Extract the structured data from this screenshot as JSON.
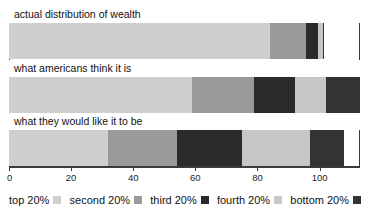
{
  "chart_data": {
    "type": "bar",
    "orientation": "horizontal",
    "stacked": true,
    "title": "",
    "subtitle": "",
    "xlabel": "",
    "ylabel": "",
    "grid": false,
    "legend_position": "bottom",
    "xlim": [
      0,
      113
    ],
    "xticks": [
      0,
      20,
      40,
      60,
      80,
      100
    ],
    "xtick_labels": [
      "0",
      "20",
      "40",
      "60",
      "80",
      "100"
    ],
    "categories": [
      "actual distribution of wealth",
      "what americans think it is",
      "what they would like it to be"
    ],
    "series": [
      {
        "name": "top 20%",
        "color": "#cfcfcf",
        "values": [
          84.0,
          59.0,
          32.0
        ]
      },
      {
        "name": "second 20%",
        "color": "#9a9a9a",
        "values": [
          11.5,
          20.0,
          22.0
        ]
      },
      {
        "name": "third 20%",
        "color": "#2b2b2b",
        "values": [
          4.0,
          13.0,
          21.0
        ]
      },
      {
        "name": "fourth 20%",
        "color": "#c6c6c6",
        "values": [
          1.5,
          10.0,
          22.0
        ]
      },
      {
        "name": "bottom 20%",
        "color": "#333333",
        "values": [
          0.4,
          11.0,
          11.0
        ]
      }
    ]
  },
  "legend": {
    "items": [
      {
        "label": "top 20%",
        "color": "#cfcfcf"
      },
      {
        "label": "second 20%",
        "color": "#9a9a9a"
      },
      {
        "label": "third 20%",
        "color": "#2b2b2b"
      },
      {
        "label": "fourth 20%",
        "color": "#c6c6c6"
      },
      {
        "label": "bottom 20%",
        "color": "#333333"
      }
    ]
  },
  "colors": {
    "axis": "#3a3a3a",
    "frame": "#3a3a3a",
    "background": "#ffffff",
    "text": "#111111"
  }
}
